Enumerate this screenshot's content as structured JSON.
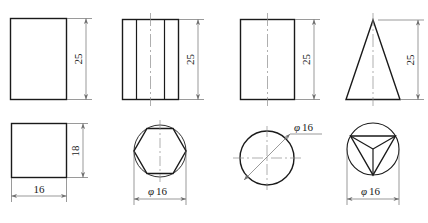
{
  "drawing": {
    "title": "Orthographic projections of four solids",
    "stroke_color": "#1a1a1a",
    "centerline_color": "#8c8c8c",
    "dimline_color": "#6e6e6e",
    "background": "#ffffff"
  },
  "views": [
    {
      "id": "rectangular-prism",
      "front_shape": "rectangle",
      "plan_shape": "square",
      "front_dimension": "25",
      "plan_vertical_dimension": "18",
      "plan_horizontal_dimension": "16"
    },
    {
      "id": "hexagonal-prism",
      "front_shape": "rectangle-with-edges",
      "plan_shape": "hexagon-in-circle",
      "front_dimension": "25",
      "plan_dimension": "16",
      "plan_dimension_prefix": "φ"
    },
    {
      "id": "cylinder",
      "front_shape": "rectangle",
      "plan_shape": "circle",
      "front_dimension": "25",
      "plan_dimension": "16",
      "plan_dimension_prefix": "φ"
    },
    {
      "id": "cone",
      "front_shape": "triangle",
      "plan_shape": "triangle-in-circle",
      "front_dimension": "25",
      "plan_dimension": "16",
      "plan_dimension_prefix": "φ"
    }
  ],
  "labels": {
    "d25_a": "25",
    "d25_b": "25",
    "d25_c": "25",
    "d25_d": "25",
    "d18": "18",
    "d16": "16",
    "phi": "φ",
    "phi16_hex_value": "16",
    "phi16_circle_value": "16",
    "phi16_cone_value": "16"
  }
}
